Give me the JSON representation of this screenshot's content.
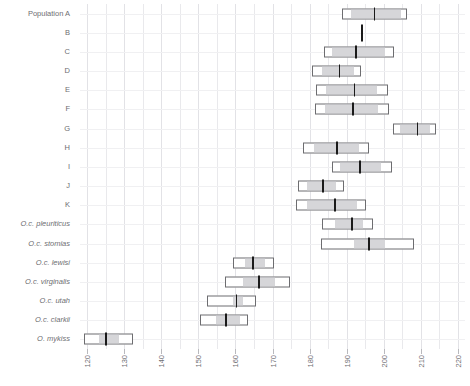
{
  "chart_data": {
    "type": "box",
    "title": "",
    "xlabel": "",
    "ylabel": "Population",
    "xlim": [
      118,
      222
    ],
    "xticks": [
      120,
      130,
      140,
      150,
      160,
      170,
      180,
      190,
      200,
      210,
      220
    ],
    "xtick_labels": [
      "120",
      "130",
      "140",
      "150",
      "160",
      "170",
      "180",
      "190",
      "200",
      "210",
      "220"
    ],
    "grid": "vertical-minor-and-major",
    "legend": "none",
    "categories": [
      "Population A",
      "B",
      "C",
      "D",
      "E",
      "F",
      "G",
      "H",
      "I",
      "J",
      "K",
      "O.c. pleuriticus",
      "O.c. stomias",
      "O.c. lewisi",
      "O.c. virginalis",
      "O.c. utah",
      "O.c. clarkii",
      "O. mykiss"
    ],
    "boxes": [
      {
        "label": "Population A",
        "italic": false,
        "min": 188.9,
        "q1": 191.1,
        "median": 197.5,
        "q3": 204.7,
        "max": 206.4
      },
      {
        "label": "B",
        "italic": false,
        "min": null,
        "q1": null,
        "median": 194.2,
        "q3": null,
        "max": null
      },
      {
        "label": "C",
        "italic": false,
        "min": 183.9,
        "q1": 186.1,
        "median": 192.5,
        "q3": 200.3,
        "max": 202.8
      },
      {
        "label": "D",
        "italic": false,
        "min": 180.6,
        "q1": 183.3,
        "median": 188.1,
        "q3": 191.9,
        "max": 193.9
      },
      {
        "label": "E",
        "italic": false,
        "min": 181.7,
        "q1": 184.4,
        "median": 192.2,
        "q3": 198.3,
        "max": 201.1
      },
      {
        "label": "F",
        "italic": false,
        "min": 181.4,
        "q1": 184.2,
        "median": 191.7,
        "q3": 198.6,
        "max": 201.4
      },
      {
        "label": "G",
        "italic": false,
        "min": 202.5,
        "q1": 204.4,
        "median": 209.2,
        "q3": 212.5,
        "max": 214.2
      },
      {
        "label": "H",
        "italic": false,
        "min": 178.3,
        "q1": 181.1,
        "median": 187.5,
        "q3": 193.3,
        "max": 196.1
      },
      {
        "label": "I",
        "italic": false,
        "min": 186.1,
        "q1": 188.3,
        "median": 193.6,
        "q3": 199.4,
        "max": 202.2
      },
      {
        "label": "J",
        "italic": false,
        "min": 176.9,
        "q1": 179.2,
        "median": 183.6,
        "q3": 187.2,
        "max": 189.2
      },
      {
        "label": "K",
        "italic": false,
        "min": 176.4,
        "q1": 179.4,
        "median": 186.9,
        "q3": 192.8,
        "max": 195.3
      },
      {
        "label": "O.c. pleuriticus",
        "italic": true,
        "min": 183.3,
        "q1": 186.9,
        "median": 191.4,
        "q3": 194.4,
        "max": 197.2
      },
      {
        "label": "O.c. stomias",
        "italic": true,
        "min": 183.1,
        "q1": 191.9,
        "median": 196.1,
        "q3": 200.3,
        "max": 208.1
      },
      {
        "label": "O.c. lewisi",
        "italic": true,
        "min": 159.2,
        "q1": 162.5,
        "median": 164.7,
        "q3": 168.1,
        "max": 170.3
      },
      {
        "label": "O.c. virginalis",
        "italic": true,
        "min": 157.2,
        "q1": 161.9,
        "median": 166.4,
        "q3": 170.8,
        "max": 174.7
      },
      {
        "label": "O.c. utah",
        "italic": true,
        "min": 152.2,
        "q1": 159.2,
        "median": 160.3,
        "q3": 161.9,
        "max": 165.6
      },
      {
        "label": "O.c. clarkii",
        "italic": true,
        "min": 150.3,
        "q1": 154.7,
        "median": 157.5,
        "q3": 161.1,
        "max": 163.3
      },
      {
        "label": "O. mykiss",
        "italic": true,
        "min": 119.2,
        "q1": 123.1,
        "median": 125.0,
        "q3": 128.6,
        "max": 132.2
      }
    ]
  },
  "style": {
    "box_border_color": "#6d6d70",
    "box_fill_color": "#ffffff",
    "iqr_fill_color": "#cfcfd2",
    "median_color": "#1a1a1a",
    "grid_color": "#e9e9ec",
    "label_color": "#6e6e72",
    "background": "#ffffff"
  }
}
